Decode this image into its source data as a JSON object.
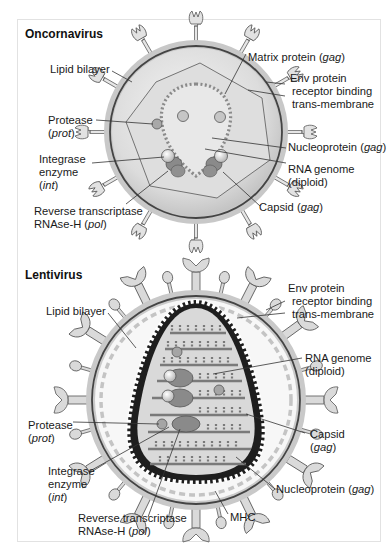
{
  "panels": [
    {
      "title": "Oncornavirus",
      "labels": {
        "lipid_bilayer": "Lipid bilayer",
        "matrix_protein": "Matrix protein (",
        "matrix_protein_gene": "gag",
        "matrix_protein_end": ")",
        "env_protein": "Env protein",
        "receptor_binding": "receptor binding",
        "trans_membrane": "trans-membrane",
        "protease": "Protease",
        "protease_gene": "prot",
        "nucleoprotein": "Nucleoprotein (",
        "nucleoprotein_gene": "gag",
        "nucleoprotein_end": ")",
        "integrase_1": "Integrase",
        "integrase_2": "enzyme",
        "integrase_gene": "int",
        "rna_genome": "RNA genome",
        "rna_diploid": "(diploid)",
        "capsid": "Capsid (",
        "capsid_gene": "gag",
        "capsid_end": ")",
        "reverse_transcriptase": "Reverse transcriptase",
        "rnase_h": "RNAse-H (",
        "rnase_h_gene": "pol",
        "rnase_h_end": ")"
      }
    },
    {
      "title": "Lentivirus",
      "labels": {
        "lipid_bilayer": "Lipid bilayer",
        "env_protein": "Env protein",
        "receptor_binding": "receptor binding",
        "trans_membrane": "trans-membrane",
        "rna_genome": "RNA genome",
        "rna_diploid": "(diploid)",
        "protease": "Protease",
        "protease_gene": "prot",
        "capsid": "Capsid",
        "capsid_gene": "gag",
        "integrase_1": "Integrase",
        "integrase_2": "enzyme",
        "integrase_gene": "int",
        "nucleoprotein": "Nucleoprotein (",
        "nucleoprotein_gene": "gag",
        "nucleoprotein_end": ")",
        "reverse_transcriptase": "Reverse transcriptase",
        "rnase_h": "RNAse-H (",
        "rnase_h_gene": "pol",
        "rnase_h_end": ")",
        "mhc": "MHC"
      }
    }
  ],
  "colors": {
    "frame_border": "#e2e2e2",
    "membrane_light": "#c9c9c9",
    "membrane_dark": "#4a4a4a",
    "interior_light": "#e9e9e9",
    "interior_mid": "#cfcfcf",
    "protein_fill": "#d6d6d6",
    "dark_protein": "#8a8a8a",
    "outline": "#555555"
  }
}
